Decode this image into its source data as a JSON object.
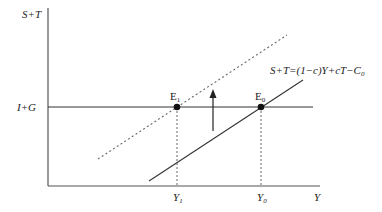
{
  "diagram": {
    "y_axis_label": "S+T",
    "x_axis_label": "Y",
    "horizontal_line_label": "I+G",
    "equation": {
      "lhs": "S+T=(1−c)Y+cT−C",
      "subscript": "0"
    },
    "points": [
      {
        "name": "E",
        "subscript": "1",
        "x_label": "Y",
        "x_subscript": "1"
      },
      {
        "name": "E",
        "subscript": "0",
        "x_label": "Y",
        "x_subscript": "0"
      }
    ],
    "arrow": "upward-shift",
    "colors": {
      "axis": "#555555",
      "line": "#333333",
      "dashed": "#666666",
      "point": "#111111"
    }
  }
}
